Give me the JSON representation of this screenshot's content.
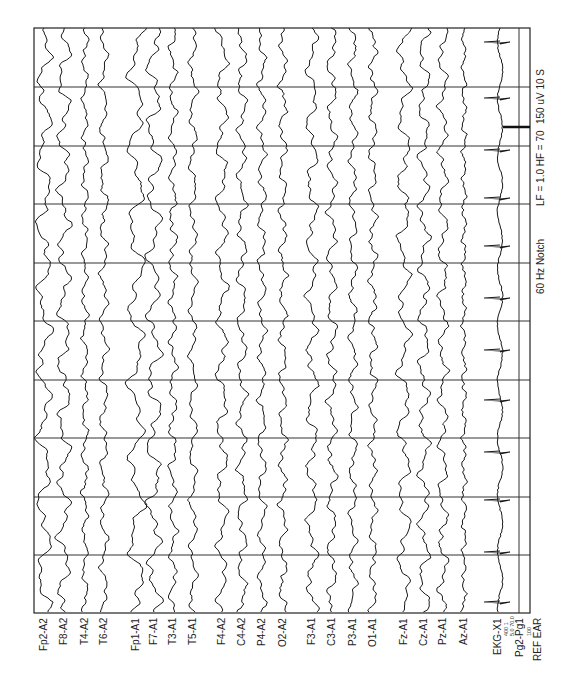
{
  "chart_data": {
    "type": "line",
    "orientation": "rotated 90 degrees; time runs top-to-bottom, channels left-to-right",
    "time_axis": {
      "duration_s": 10,
      "gridline_interval_s": 1,
      "divisions": 10
    },
    "settings": {
      "sensitivity": "150 uV",
      "timebase": "10 S",
      "low_filter": "LF = 1.0",
      "high_filter": "HF = 70",
      "notch": "60 Hz Notch"
    },
    "reference": "REF EAR",
    "channel_groups": [
      [
        "Fp2-A2",
        "F8-A2",
        "T4-A2",
        "T6-A2"
      ],
      [
        "Fp1-A1",
        "F7-A1",
        "T3-A1",
        "T5-A1"
      ],
      [
        "F4-A2",
        "C4-A2",
        "P4-A2",
        "O2-A2"
      ],
      [
        "F3-A1",
        "C3-A1",
        "P3-A1",
        "O1-A1"
      ],
      [
        "Fz-A1",
        "Cz-A1",
        "Pz-A1",
        "Az-A1"
      ],
      [
        "EKG-X1"
      ],
      [
        "Pg2-Pg1"
      ]
    ],
    "ekg": {
      "label": "EKG-X1",
      "sub_labels": [
        "400",
        "1",
        "5.0 70.0"
      ],
      "qrs_spikes_approx_count": 12
    },
    "pg": {
      "label": "Pg2-Pg1",
      "sub_label": "100",
      "trace": "flat"
    },
    "calibration_bar": {
      "label": "150 uV",
      "position_s": 1.7
    }
  },
  "frame": {
    "left": 34,
    "top": 28,
    "right": 530,
    "bottom": 613
  },
  "gridlines_y": [
    87,
    146,
    204,
    263,
    321,
    380,
    438,
    497,
    555
  ],
  "channels": [
    {
      "label": "Fp2-A2",
      "x": 44,
      "amp": 9,
      "freq": 0.9,
      "seed": 1
    },
    {
      "label": "F8-A2",
      "x": 64,
      "amp": 8,
      "freq": 1.1,
      "seed": 2
    },
    {
      "label": "T4-A2",
      "x": 85,
      "amp": 4,
      "freq": 1.6,
      "seed": 3
    },
    {
      "label": "T6-A2",
      "x": 104,
      "amp": 5,
      "freq": 1.3,
      "seed": 4
    },
    {
      "label": "Fp1-A1",
      "x": 136,
      "amp": 10,
      "freq": 0.8,
      "seed": 5
    },
    {
      "label": "F7-A1",
      "x": 154,
      "amp": 9,
      "freq": 1.0,
      "seed": 6
    },
    {
      "label": "T3-A1",
      "x": 173,
      "amp": 5,
      "freq": 1.5,
      "seed": 7
    },
    {
      "label": "T5-A1",
      "x": 193,
      "amp": 5,
      "freq": 1.3,
      "seed": 8
    },
    {
      "label": "F4-A2",
      "x": 222,
      "amp": 7,
      "freq": 1.1,
      "seed": 9
    },
    {
      "label": "C4-A2",
      "x": 242,
      "amp": 6,
      "freq": 1.3,
      "seed": 10
    },
    {
      "label": "P4-A2",
      "x": 262,
      "amp": 5,
      "freq": 1.4,
      "seed": 11
    },
    {
      "label": "O2-A2",
      "x": 283,
      "amp": 5,
      "freq": 1.5,
      "seed": 12
    },
    {
      "label": "F3-A1",
      "x": 312,
      "amp": 7,
      "freq": 1.1,
      "seed": 13
    },
    {
      "label": "C3-A1",
      "x": 332,
      "amp": 6,
      "freq": 1.3,
      "seed": 14
    },
    {
      "label": "P3-A1",
      "x": 353,
      "amp": 5,
      "freq": 1.4,
      "seed": 15
    },
    {
      "label": "O1-A1",
      "x": 373,
      "amp": 5,
      "freq": 1.5,
      "seed": 16
    },
    {
      "label": "Fz-A1",
      "x": 404,
      "amp": 8,
      "freq": 1.0,
      "seed": 17
    },
    {
      "label": "Cz-A1",
      "x": 424,
      "amp": 7,
      "freq": 1.2,
      "seed": 18
    },
    {
      "label": "Pz-A1",
      "x": 443,
      "amp": 6,
      "freq": 1.3,
      "seed": 19
    },
    {
      "label": "Az-A1",
      "x": 464,
      "amp": 3,
      "freq": 2.2,
      "seed": 20
    }
  ],
  "ekg_channel": {
    "label": "EKG-X1",
    "x": 500,
    "spikes_y": [
      42,
      98,
      150,
      198,
      246,
      298,
      350,
      400,
      452,
      500,
      552,
      602
    ]
  },
  "pg_channel": {
    "label": "Pg2-Pg1",
    "x": 519
  },
  "ekg_sub": {
    "line1": "400   1",
    "line2": "5.0 70.0"
  },
  "pg_sub": "100",
  "ref_label": "REF EAR",
  "calibration": {
    "y": 127,
    "x1": 503,
    "x2": 530
  },
  "annotations": {
    "cal": "150 uV 10 S",
    "filters": "LF = 1.0  HF = 70",
    "notch": "60 Hz Notch"
  }
}
